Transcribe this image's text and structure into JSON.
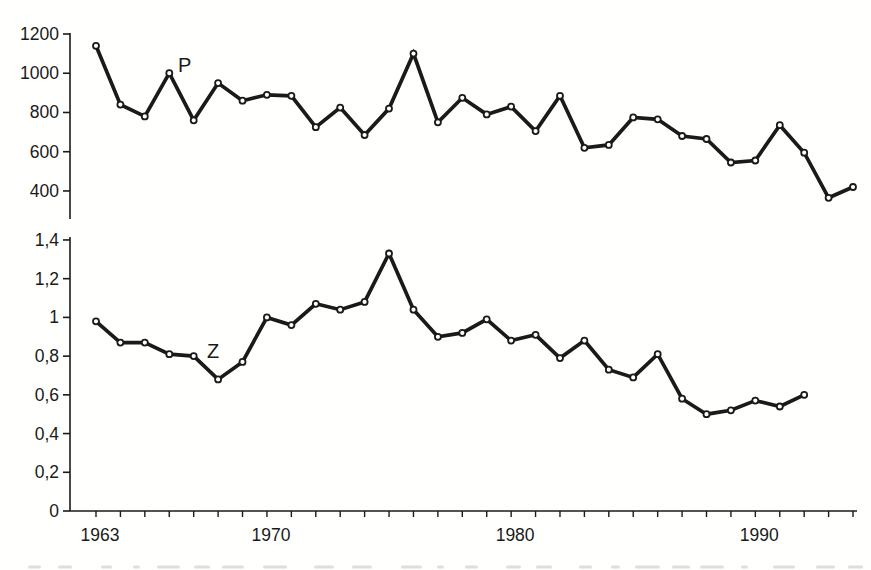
{
  "figure": {
    "background": "#fffffe",
    "ink_color": "#1a1a1a",
    "marker_fill": "#ffffff"
  },
  "chart_data": {
    "type": "line",
    "title": "",
    "xlabel": "",
    "ylabel": "",
    "grid": false,
    "legend": "inline-labels",
    "marker": "open-circle",
    "line_color": "#1a1a1a",
    "x_axis": {
      "tick_years_start": 1963,
      "tick_years_end": 1994,
      "labeled_years": [
        1963,
        1970,
        1980,
        1990
      ],
      "labeled_ticks": [
        "1963",
        "1970",
        "1980",
        "1990"
      ]
    },
    "panels": [
      {
        "id": "P",
        "series_label": "P",
        "ylim": [
          300,
          1250
        ],
        "yticks": [
          400,
          600,
          800,
          1000,
          1200
        ],
        "ytick_labels": [
          "400",
          "600",
          "800",
          "1000",
          "1200"
        ],
        "years": [
          1963,
          1964,
          1965,
          1966,
          1967,
          1968,
          1969,
          1970,
          1971,
          1972,
          1973,
          1974,
          1975,
          1976,
          1977,
          1978,
          1979,
          1980,
          1981,
          1982,
          1983,
          1984,
          1985,
          1986,
          1987,
          1988,
          1989,
          1990,
          1991,
          1992,
          1993,
          1994
        ],
        "values": [
          1140,
          840,
          780,
          1000,
          760,
          950,
          860,
          890,
          885,
          725,
          825,
          685,
          820,
          1100,
          750,
          875,
          790,
          830,
          705,
          885,
          620,
          635,
          775,
          765,
          680,
          665,
          545,
          555,
          735,
          595,
          365,
          420
        ]
      },
      {
        "id": "Z",
        "series_label": "Z",
        "ylim": [
          0,
          1.45
        ],
        "yticks": [
          0,
          0.2,
          0.4,
          0.6,
          0.8,
          1,
          1.2,
          1.4
        ],
        "ytick_labels": [
          "0",
          "0,2",
          "0,4",
          "0,6",
          "0,8",
          "1",
          "1,2",
          "1,4"
        ],
        "years": [
          1963,
          1964,
          1965,
          1966,
          1967,
          1968,
          1969,
          1970,
          1971,
          1972,
          1973,
          1974,
          1975,
          1976,
          1977,
          1978,
          1979,
          1980,
          1981,
          1982,
          1983,
          1984,
          1985,
          1986,
          1987,
          1988,
          1989,
          1990,
          1991,
          1992
        ],
        "values": [
          0.98,
          0.87,
          0.87,
          0.81,
          0.8,
          0.68,
          0.77,
          1.0,
          0.96,
          1.07,
          1.04,
          1.08,
          1.33,
          1.04,
          0.9,
          0.92,
          0.99,
          0.88,
          0.91,
          0.79,
          0.88,
          0.73,
          0.69,
          0.81,
          0.58,
          0.5,
          0.52,
          0.57,
          0.54,
          0.6
        ]
      }
    ]
  }
}
